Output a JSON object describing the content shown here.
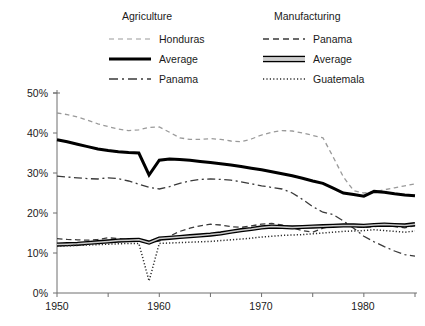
{
  "chart_data": {
    "type": "line",
    "title": "",
    "xlabel": "",
    "ylabel": "",
    "xlim": [
      1950,
      1985
    ],
    "ylim": [
      0,
      50
    ],
    "y_tick_labels": [
      "0%",
      "10%",
      "20%",
      "30%",
      "40%",
      "50%"
    ],
    "y_ticks": [
      0,
      10,
      20,
      30,
      40,
      50
    ],
    "x_tick_labels": [
      "1950",
      "1960",
      "1970",
      "1980"
    ],
    "x_ticks_major": [
      1950,
      1960,
      1970,
      1980
    ],
    "x_ticks_all": [
      1950,
      1955,
      1960,
      1965,
      1970,
      1975,
      1980,
      1985
    ],
    "grid": false,
    "legend_position": "top",
    "legend_groups": [
      {
        "title": "Agriculture",
        "entries": [
          {
            "label": "Honduras",
            "style": "dashed-light"
          },
          {
            "label": "Average",
            "style": "thick-solid"
          },
          {
            "label": "Panama",
            "style": "dash-dot"
          }
        ]
      },
      {
        "title": "Manufacturing",
        "entries": [
          {
            "label": "Panama",
            "style": "dashed"
          },
          {
            "label": "Average",
            "style": "double-line"
          },
          {
            "label": "Guatemala",
            "style": "dotted"
          }
        ]
      }
    ],
    "x": [
      1950,
      1951,
      1952,
      1953,
      1954,
      1955,
      1956,
      1957,
      1958,
      1959,
      1960,
      1961,
      1962,
      1963,
      1964,
      1965,
      1966,
      1967,
      1968,
      1969,
      1970,
      1971,
      1972,
      1973,
      1974,
      1975,
      1976,
      1977,
      1978,
      1979,
      1980,
      1981,
      1982,
      1983,
      1984,
      1985
    ],
    "series": [
      {
        "name": "Honduras",
        "group": "Agriculture",
        "style": "dashed-light",
        "color": "#8a8a8a",
        "values": [
          45.0,
          44.6,
          44.0,
          43.2,
          42.3,
          41.6,
          41.0,
          40.6,
          40.8,
          41.4,
          41.5,
          40.2,
          38.8,
          38.4,
          38.4,
          38.6,
          38.4,
          38.0,
          37.8,
          38.5,
          39.5,
          40.2,
          40.6,
          40.5,
          40.0,
          39.4,
          38.8,
          34.0,
          29.0,
          25.6,
          25.0,
          25.3,
          25.8,
          26.3,
          26.8,
          27.3
        ]
      },
      {
        "name": "Average",
        "group": "Agriculture",
        "style": "thick-solid",
        "color": "#000000",
        "values": [
          38.3,
          37.8,
          37.2,
          36.6,
          36.0,
          35.6,
          35.3,
          35.1,
          35.0,
          29.5,
          33.2,
          33.5,
          33.4,
          33.2,
          32.9,
          32.6,
          32.3,
          32.0,
          31.6,
          31.2,
          30.8,
          30.3,
          29.8,
          29.3,
          28.7,
          28.0,
          27.4,
          26.2,
          25.0,
          24.6,
          24.2,
          25.4,
          25.2,
          24.8,
          24.5,
          24.3
        ]
      },
      {
        "name": "Panama",
        "group": "Agriculture",
        "style": "dash-dot",
        "color": "#3a3a3a",
        "values": [
          29.2,
          29.0,
          28.8,
          28.6,
          28.5,
          28.8,
          28.6,
          28.0,
          27.2,
          26.4,
          26.0,
          26.6,
          27.4,
          28.0,
          28.4,
          28.5,
          28.4,
          28.2,
          27.8,
          27.3,
          26.8,
          26.4,
          26.0,
          25.0,
          23.4,
          21.6,
          20.2,
          19.6,
          18.0,
          16.2,
          14.2,
          12.8,
          11.6,
          10.5,
          9.6,
          9.2
        ]
      },
      {
        "name": "Panama",
        "group": "Manufacturing",
        "style": "dashed",
        "color": "#3a3a3a",
        "values": [
          13.6,
          13.4,
          13.3,
          13.2,
          13.4,
          13.8,
          13.6,
          13.3,
          13.0,
          12.6,
          13.0,
          14.2,
          15.4,
          16.2,
          16.8,
          17.2,
          17.0,
          16.6,
          16.4,
          16.8,
          17.2,
          17.4,
          17.0,
          16.3,
          15.6,
          15.2,
          16.2,
          16.8,
          17.0,
          16.6,
          16.4,
          16.6,
          16.8,
          16.6,
          16.3,
          16.8
        ]
      },
      {
        "name": "Average",
        "group": "Manufacturing",
        "style": "double-line",
        "color": "#000000",
        "values": [
          12.1,
          12.2,
          12.3,
          12.5,
          12.7,
          12.9,
          13.1,
          13.2,
          13.3,
          12.6,
          13.6,
          13.8,
          14.0,
          14.2,
          14.4,
          14.6,
          14.9,
          15.3,
          15.7,
          16.0,
          16.4,
          16.6,
          16.5,
          16.4,
          16.5,
          16.6,
          16.7,
          16.8,
          16.9,
          16.9,
          16.8,
          17.0,
          17.1,
          17.0,
          16.9,
          17.2
        ]
      },
      {
        "name": "Guatemala",
        "group": "Manufacturing",
        "style": "dotted",
        "color": "#2a2a2a",
        "values": [
          11.7,
          11.8,
          11.9,
          12.0,
          12.1,
          12.2,
          12.3,
          12.4,
          12.4,
          3.0,
          12.4,
          12.5,
          12.6,
          12.7,
          12.8,
          12.9,
          13.1,
          13.3,
          13.5,
          13.7,
          14.0,
          14.2,
          14.4,
          14.5,
          14.6,
          14.8,
          15.0,
          15.2,
          15.4,
          15.5,
          15.6,
          15.8,
          15.6,
          15.4,
          15.2,
          15.5
        ]
      }
    ]
  }
}
